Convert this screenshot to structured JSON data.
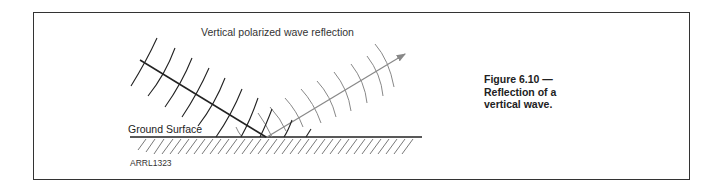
{
  "diagram": {
    "title": "Vertical polarized wave reflection",
    "ground_label": "Ground Surface",
    "figure_code": "ARRL1323",
    "caption": {
      "line1": "Figure 6.10 —",
      "line2": "Reflection of a",
      "line3": "vertical wave."
    },
    "colors": {
      "incident": "#222222",
      "reflected": "#888888",
      "ground": "#222222",
      "hatch": "#555555",
      "frame": "#333333"
    }
  }
}
